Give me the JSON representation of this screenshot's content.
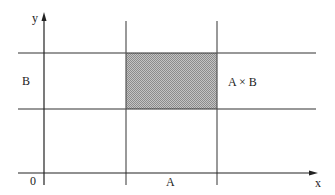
{
  "diagram": {
    "axes": {
      "x_label": "x",
      "y_label": "y",
      "origin_label": "0"
    },
    "labels": {
      "set_a": "A",
      "set_b": "B",
      "product": "A × B"
    },
    "colors": {
      "line": "#333333",
      "axis": "#222222",
      "fill": "#a8a8a8",
      "text": "#222222"
    },
    "geometry": {
      "x_axis_y": 173,
      "y_axis_x": 44,
      "a_interval_x": [
        126,
        217
      ],
      "b_interval_y": [
        53,
        109
      ],
      "horizontal_lines_x_extent": [
        18,
        316
      ],
      "vertical_lines_y_extent": [
        21,
        185
      ]
    }
  }
}
